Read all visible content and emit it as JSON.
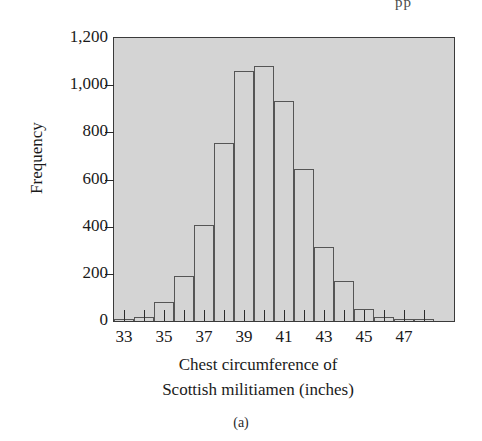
{
  "figure": {
    "panel_caption": "(a)",
    "page_artifact": "pp"
  },
  "chart_data": {
    "type": "bar",
    "title": "",
    "subtitle": "",
    "xlabel_lines": [
      "Chest circumference of",
      "Scottish militiamen (inches)"
    ],
    "xlabel": "Chest circumference of Scottish militiamen (inches)",
    "ylabel": "Frequency",
    "ylim": [
      0,
      1200
    ],
    "yticks": [
      0,
      200,
      400,
      600,
      800,
      1000,
      1200
    ],
    "ytick_labels": [
      "0",
      "200",
      "400",
      "600",
      "800",
      "1,000",
      "1,200"
    ],
    "xlim": [
      32.5,
      49.5
    ],
    "xticks": [
      33,
      34,
      35,
      36,
      37,
      38,
      39,
      40,
      41,
      42,
      43,
      44,
      45,
      46,
      47,
      48
    ],
    "xtick_labels_shown": [
      "33",
      "35",
      "37",
      "39",
      "41",
      "43",
      "45",
      "47"
    ],
    "xtick_labels_shown_values": [
      33,
      35,
      37,
      39,
      41,
      43,
      45,
      47
    ],
    "grid": false,
    "legend": false,
    "bin_width": 1,
    "categories": [
      33,
      34,
      35,
      36,
      37,
      38,
      39,
      40,
      41,
      42,
      43,
      44,
      45,
      46,
      47,
      48
    ],
    "bin_labels": [
      "33",
      "34",
      "35",
      "36",
      "37",
      "38",
      "39",
      "40",
      "41",
      "42",
      "43",
      "44",
      "45",
      "46",
      "47",
      "48"
    ],
    "values": [
      3,
      19,
      81,
      189,
      409,
      753,
      1062,
      1082,
      935,
      646,
      313,
      168,
      50,
      18,
      3,
      1
    ],
    "bar_face_color": "#d4d4d4",
    "bar_edge_color": "#555555",
    "plot_background_color": "#d4d4d4",
    "axis_color": "#2b2b2b"
  }
}
